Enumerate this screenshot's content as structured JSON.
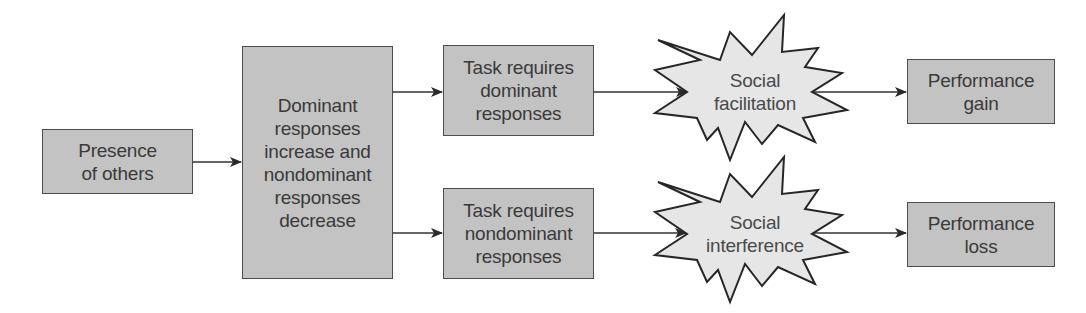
{
  "diagram": {
    "title": "",
    "colors": {
      "box_fill": "#c3c3c3",
      "box_border": "#4d4d4d",
      "star_fill": "#e6e6e6",
      "star_border": "#2a2a2a",
      "arrow": "#333333",
      "text": "#3a3a3a"
    },
    "nodes": {
      "presence": {
        "label": "Presence\nof others"
      },
      "dominant_responses": {
        "label": "Dominant\nresponses\nincrease and\nnondominant\nresponses\ndecrease"
      },
      "task_dominant": {
        "label": "Task requires\ndominant\nresponses"
      },
      "task_nondominant": {
        "label": "Task requires\nnondominant\nresponses"
      },
      "social_facilitation": {
        "label": "Social\nfacilitation"
      },
      "social_interference": {
        "label": "Social\ninterference"
      },
      "performance_gain": {
        "label": "Performance\ngain"
      },
      "performance_loss": {
        "label": "Performance\nloss"
      }
    },
    "edges": [
      {
        "from": "presence",
        "to": "dominant_responses"
      },
      {
        "from": "dominant_responses",
        "to": "task_dominant"
      },
      {
        "from": "dominant_responses",
        "to": "task_nondominant"
      },
      {
        "from": "task_dominant",
        "to": "social_facilitation"
      },
      {
        "from": "task_nondominant",
        "to": "social_interference"
      },
      {
        "from": "social_facilitation",
        "to": "performance_gain"
      },
      {
        "from": "social_interference",
        "to": "performance_loss"
      }
    ]
  }
}
